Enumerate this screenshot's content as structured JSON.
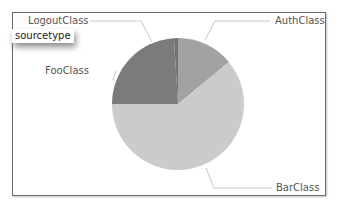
{
  "chart_data": {
    "type": "pie",
    "title": "",
    "field": "sourcetype",
    "categories": [
      "AuthClass",
      "BarClass",
      "FooClass",
      "LogoutClass"
    ],
    "values": [
      14,
      61,
      24,
      1
    ],
    "colors": [
      "#a2a2a2",
      "#cbcbcb",
      "#7b7b7b",
      "#747474"
    ],
    "start_angle_deg": 0,
    "direction": "clockwise",
    "legend": "none (leader-line labels)"
  },
  "labels": {
    "auth": "AuthClass",
    "bar": "BarClass",
    "foo": "FooClass",
    "logout": "LogoutClass"
  },
  "tooltip": {
    "text": "sourcetype"
  }
}
